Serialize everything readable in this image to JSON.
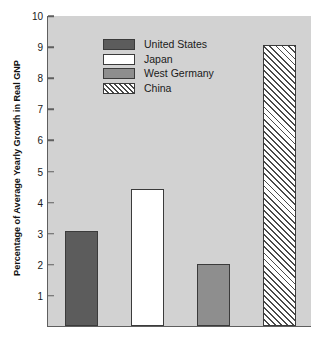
{
  "chart_data": {
    "type": "bar",
    "title": "",
    "xlabel": "",
    "ylabel": "Percentage of Average Yearly Growth in Real GNP",
    "ylim": [
      0,
      10
    ],
    "ytick_values": [
      1,
      2,
      3,
      4,
      5,
      6,
      7,
      8,
      9,
      10
    ],
    "ytick_labels": [
      "1",
      "2",
      "3",
      "4",
      "5",
      "6",
      "7",
      "8",
      "9",
      "10"
    ],
    "xtick_labels": [],
    "grid": false,
    "legend_position": "upper-left",
    "categories": [
      "United States",
      "Japan",
      "West Germany",
      "China"
    ],
    "values": [
      3.05,
      4.4,
      2.0,
      9.05
    ],
    "series": [
      {
        "name": "Average Yearly Growth in Real GNP",
        "values": [
          3.05,
          4.4,
          2.0,
          9.05
        ]
      }
    ],
    "bars": [
      {
        "label": "United States",
        "value": 3.05,
        "fill": "#5c5c5c",
        "pattern": "solid"
      },
      {
        "label": "Japan",
        "value": 4.4,
        "fill": "#ffffff",
        "pattern": "solid"
      },
      {
        "label": "West Germany",
        "value": 2.0,
        "fill": "#8e8e8e",
        "pattern": "solid"
      },
      {
        "label": "China",
        "value": 9.05,
        "fill": "#ffffff",
        "pattern": "diagonal-hatch"
      }
    ]
  },
  "legend": {
    "items": [
      {
        "label": "United States",
        "swatch": "legend-swatch-united-states"
      },
      {
        "label": "Japan",
        "swatch": "legend-swatch-japan"
      },
      {
        "label": "West Germany",
        "swatch": "legend-swatch-west-germany"
      },
      {
        "label": "China",
        "swatch": "legend-swatch-china"
      }
    ]
  },
  "colors": {
    "plot_background": "#d2d2d2",
    "axis_line": "#5f5f5f",
    "bar_outline": "#3b3b3b",
    "united_states": "#5c5c5c",
    "japan": "#ffffff",
    "west_germany": "#8e8e8e",
    "china_hatch": "#4a4a4a",
    "text": "#1a1a1a"
  }
}
